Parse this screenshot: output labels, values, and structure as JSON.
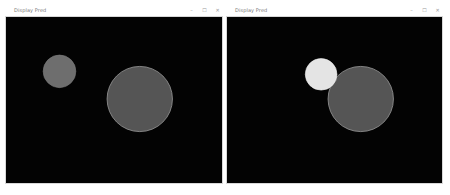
{
  "windows": [
    {
      "title": "Display Pred",
      "controls": {
        "minimize": "–",
        "maximize": "☐",
        "close": "✕"
      },
      "circles": [
        {
          "cx": 54,
          "cy": 55,
          "r": 16.5,
          "fill": "#6e6e6e",
          "stroke": "#7a7a7a"
        },
        {
          "cx": 135,
          "cy": 83,
          "r": 33,
          "fill": "#555555",
          "stroke": "#9a9a9a"
        }
      ]
    },
    {
      "title": "Display Pred",
      "controls": {
        "minimize": "–",
        "maximize": "☐",
        "close": "✕"
      },
      "circles": [
        {
          "cx": 95,
          "cy": 58,
          "r": 16,
          "fill": "#e4e4e4",
          "stroke": "#f0f0f0"
        },
        {
          "cx": 135,
          "cy": 83,
          "r": 33,
          "fill": "#555555",
          "stroke": "#9a9a9a"
        }
      ]
    }
  ],
  "colors": {
    "canvas_background": "#030303",
    "titlebar_background": "#ffffff",
    "title_text": "#777777"
  }
}
